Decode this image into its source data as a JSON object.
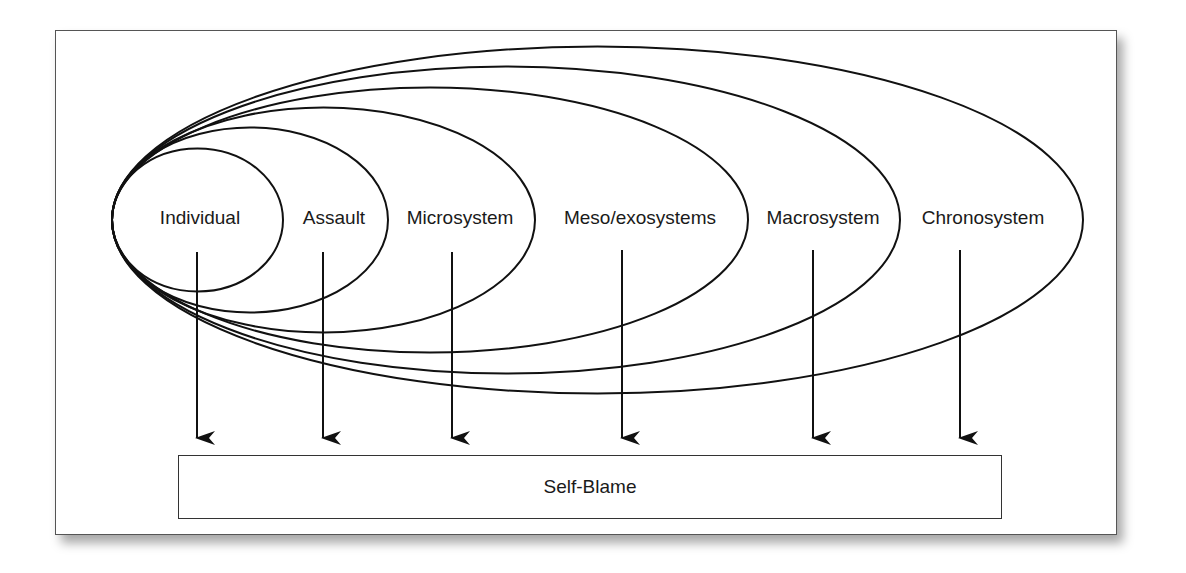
{
  "diagram": {
    "systems": [
      {
        "label": "Individual",
        "rx": 85.5,
        "ry": 71.5,
        "cx": 197.5,
        "label_x": 200,
        "arrow_x": 197
      },
      {
        "label": "Assault",
        "rx": 138,
        "ry": 92.5,
        "cx": 250,
        "label_x": 334,
        "arrow_x": 323
      },
      {
        "label": "Microsystem",
        "rx": 211.5,
        "ry": 112.5,
        "cx": 323.5,
        "label_x": 460,
        "arrow_x": 452
      },
      {
        "label": "Meso/exosystems",
        "rx": 318,
        "ry": 132.5,
        "cx": 430,
        "label_x": 640,
        "arrow_x": 622
      },
      {
        "label": "Macrosystem",
        "rx": 394,
        "ry": 153.5,
        "cx": 506,
        "label_x": 823,
        "arrow_x": 813
      },
      {
        "label": "Chronosystem",
        "rx": 485.5,
        "ry": 173.5,
        "cx": 597.5,
        "label_x": 983,
        "arrow_x": 960
      }
    ],
    "outcome": {
      "label": "Self-Blame"
    },
    "colors": {
      "line": "#111111",
      "frame": "#555555",
      "background": "#ffffff"
    }
  }
}
